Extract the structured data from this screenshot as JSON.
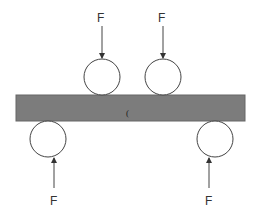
{
  "diagram": {
    "colors": {
      "background": "#ffffff",
      "beam_fill": "#7c7c7c",
      "beam_edge": "#666666",
      "line": "#444444",
      "roller_fill": "#ffffff",
      "label": "#333333"
    },
    "beam": {
      "x": 16,
      "y": 95,
      "width": 229,
      "height": 26,
      "mark": "("
    },
    "loads": [
      {
        "id": "top-left",
        "label": "F",
        "direction": "down",
        "roller_cx": 102,
        "roller_cy": 77,
        "r": 18
      },
      {
        "id": "top-right",
        "label": "F",
        "direction": "down",
        "roller_cx": 163,
        "roller_cy": 77,
        "r": 18
      },
      {
        "id": "bottom-left",
        "label": "F",
        "direction": "up",
        "roller_cx": 48,
        "roller_cy": 139,
        "r": 18
      },
      {
        "id": "bottom-right",
        "label": "F",
        "direction": "up",
        "roller_cx": 215,
        "roller_cy": 139,
        "r": 18
      }
    ]
  }
}
